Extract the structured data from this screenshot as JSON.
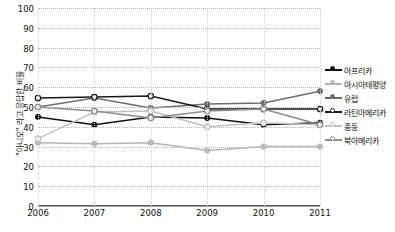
{
  "chart_data": {
    "type": "line",
    "title": "",
    "xlabel": "",
    "ylabel": "\"아니오\" 라고 응답한 비율",
    "categories": [
      "2006",
      "2007",
      "2008",
      "2009",
      "2010",
      "2011"
    ],
    "ylim": [
      0,
      100
    ],
    "yticks": [
      "0",
      "10",
      "20",
      "30",
      "40",
      "50",
      "60",
      "70",
      "80",
      "90",
      "100"
    ],
    "grid": "horizontal-dotted",
    "legend_position": "right",
    "series": [
      {
        "name": "아프리카",
        "color": "#101010",
        "marker": "filled-circle",
        "values": [
          45,
          41,
          45,
          44.5,
          41,
          42
        ]
      },
      {
        "name": "아시아태평양",
        "color": "#b5b5b5",
        "marker": "filled-circle",
        "values": [
          32,
          31.5,
          32,
          28,
          30,
          30
        ]
      },
      {
        "name": "유럽",
        "color": "#6e6e6e",
        "marker": "filled-circle",
        "values": [
          50,
          54.5,
          49.5,
          51.5,
          52,
          58
        ]
      },
      {
        "name": "라틴아메리카",
        "color": "#1a1a1a",
        "marker": "open-circle",
        "values": [
          54.5,
          55,
          55.5,
          49,
          49,
          49
        ]
      },
      {
        "name": "중동",
        "color": "#c2c2c2",
        "marker": "open-circle",
        "values": [
          34,
          47.5,
          48,
          40,
          42,
          41
        ]
      },
      {
        "name": "북아메리카",
        "color": "#8c8c8c",
        "marker": "open-circle",
        "values": [
          50,
          48,
          44.5,
          48,
          49,
          41
        ]
      }
    ]
  }
}
